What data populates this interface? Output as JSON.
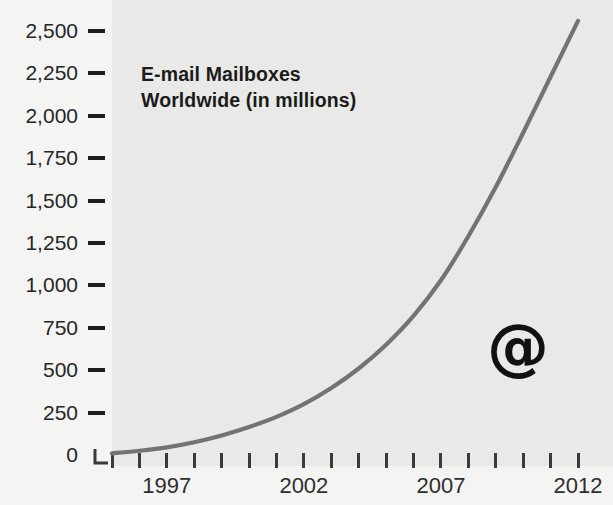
{
  "figure": {
    "width": 613,
    "height": 505,
    "background_color": "#f3f3f1",
    "plot_background_color": "#e9e9e7"
  },
  "title": {
    "line1": "E-mail Mailboxes",
    "line2": "Worldwide (in millions)"
  },
  "annotations": {
    "at_symbol": "@"
  },
  "axis": {
    "y_tick_labels": [
      "2,500",
      "2,250",
      "2,000",
      "1,750",
      "1,500",
      "1,250",
      "1,000",
      "750",
      "500",
      "250",
      "0"
    ],
    "x_tick_labels": [
      "1997",
      "2002",
      "2007",
      "2012"
    ]
  },
  "chart_data": {
    "type": "line",
    "title": "E-mail Mailboxes Worldwide (in millions)",
    "xlabel": "",
    "ylabel": "",
    "xlim": [
      1995,
      2012
    ],
    "ylim": [
      0,
      2500
    ],
    "ytick_values": [
      0,
      250,
      500,
      750,
      1000,
      1250,
      1500,
      1750,
      2000,
      2250,
      2500
    ],
    "ytick_labels": [
      "0",
      "250",
      "500",
      "750",
      "1,000",
      "1,250",
      "1,500",
      "1,750",
      "2,000",
      "2,250",
      "2,500"
    ],
    "xtick_values": [
      1995,
      1996,
      1997,
      1998,
      1999,
      2000,
      2001,
      2002,
      2003,
      2004,
      2005,
      2006,
      2007,
      2008,
      2009,
      2010,
      2011,
      2012
    ],
    "xtick_labels_shown": [
      "1997",
      "2002",
      "2007",
      "2012"
    ],
    "grid": false,
    "legend": null,
    "line_color": "#737373",
    "line_width": 4,
    "x": [
      1995,
      1996,
      1997,
      1998,
      1999,
      2000,
      2001,
      2002,
      2003,
      2004,
      2005,
      2006,
      2007,
      2008,
      2009,
      2010,
      2011,
      2012
    ],
    "y": [
      10,
      25,
      45,
      75,
      115,
      165,
      225,
      300,
      395,
      510,
      650,
      820,
      1030,
      1290,
      1580,
      1900,
      2230,
      2560
    ],
    "series": [
      {
        "name": "E-mail mailboxes worldwide (millions)",
        "values": [
          10,
          25,
          45,
          75,
          115,
          165,
          225,
          300,
          395,
          510,
          650,
          820,
          1030,
          1290,
          1580,
          1900,
          2230,
          2560
        ]
      }
    ]
  }
}
